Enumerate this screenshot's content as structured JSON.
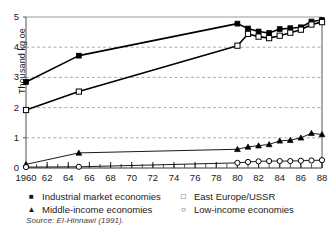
{
  "chart_data": {
    "type": "line",
    "title": "",
    "xlabel": "",
    "ylabel": "Thousand kg oe",
    "xlim": [
      1960,
      1988
    ],
    "ylim": [
      0,
      5
    ],
    "yticks": [
      0,
      1,
      2,
      3,
      4,
      5
    ],
    "xticks": [
      1960,
      62,
      64,
      66,
      68,
      70,
      72,
      74,
      76,
      78,
      80,
      82,
      84,
      86,
      88
    ],
    "xtick_labels": [
      "1960",
      "62",
      "64",
      "66",
      "68",
      "70",
      "72",
      "74",
      "76",
      "78",
      "80",
      "82",
      "84",
      "86",
      "88"
    ],
    "minor_xticks_every": 1,
    "grid": "horizontal-dashed",
    "legend_position": "below-axes",
    "series": [
      {
        "name": "Industrial market economies",
        "marker": "filled-square",
        "color": "#000000",
        "x": [
          1960,
          1965,
          1980,
          1981,
          1982,
          1983,
          1984,
          1985,
          1986,
          1987,
          1988
        ],
        "y": [
          2.85,
          3.72,
          4.78,
          4.62,
          4.52,
          4.47,
          4.6,
          4.63,
          4.66,
          4.85,
          4.9
        ]
      },
      {
        "name": "East Europe/USSR",
        "marker": "open-square",
        "color": "#000000",
        "x": [
          1960,
          1965,
          1980,
          1981,
          1982,
          1983,
          1984,
          1985,
          1986,
          1987,
          1988
        ],
        "y": [
          1.92,
          2.53,
          4.05,
          4.44,
          4.35,
          4.3,
          4.38,
          4.48,
          4.58,
          4.75,
          4.83
        ]
      },
      {
        "name": "Middle-income economies",
        "marker": "filled-triangle",
        "color": "#000000",
        "x": [
          1960,
          1965,
          1980,
          1981,
          1982,
          1983,
          1984,
          1985,
          1986,
          1987,
          1988
        ],
        "y": [
          0.12,
          0.5,
          0.62,
          0.7,
          0.74,
          0.78,
          0.9,
          0.92,
          1.0,
          1.15,
          1.11
        ]
      },
      {
        "name": "Low-income economies",
        "marker": "open-circle",
        "color": "#000000",
        "x": [
          1960,
          1965,
          1980,
          1981,
          1982,
          1983,
          1984,
          1985,
          1986,
          1987,
          1988
        ],
        "y": [
          0.03,
          0.04,
          0.17,
          0.2,
          0.22,
          0.23,
          0.23,
          0.23,
          0.24,
          0.25,
          0.26
        ]
      }
    ]
  },
  "axes": {
    "ylabel": "Thousand kg oe"
  },
  "legend": {
    "items": [
      {
        "label": "Industrial market economies",
        "marker": "filled-square"
      },
      {
        "label": "East Europe/USSR",
        "marker": "open-square"
      },
      {
        "label": "Middle-income economies",
        "marker": "filled-triangle"
      },
      {
        "label": "Low-income economies",
        "marker": "open-circle"
      }
    ]
  },
  "source": {
    "text": "Source: El-Hinnawi (1991)."
  }
}
